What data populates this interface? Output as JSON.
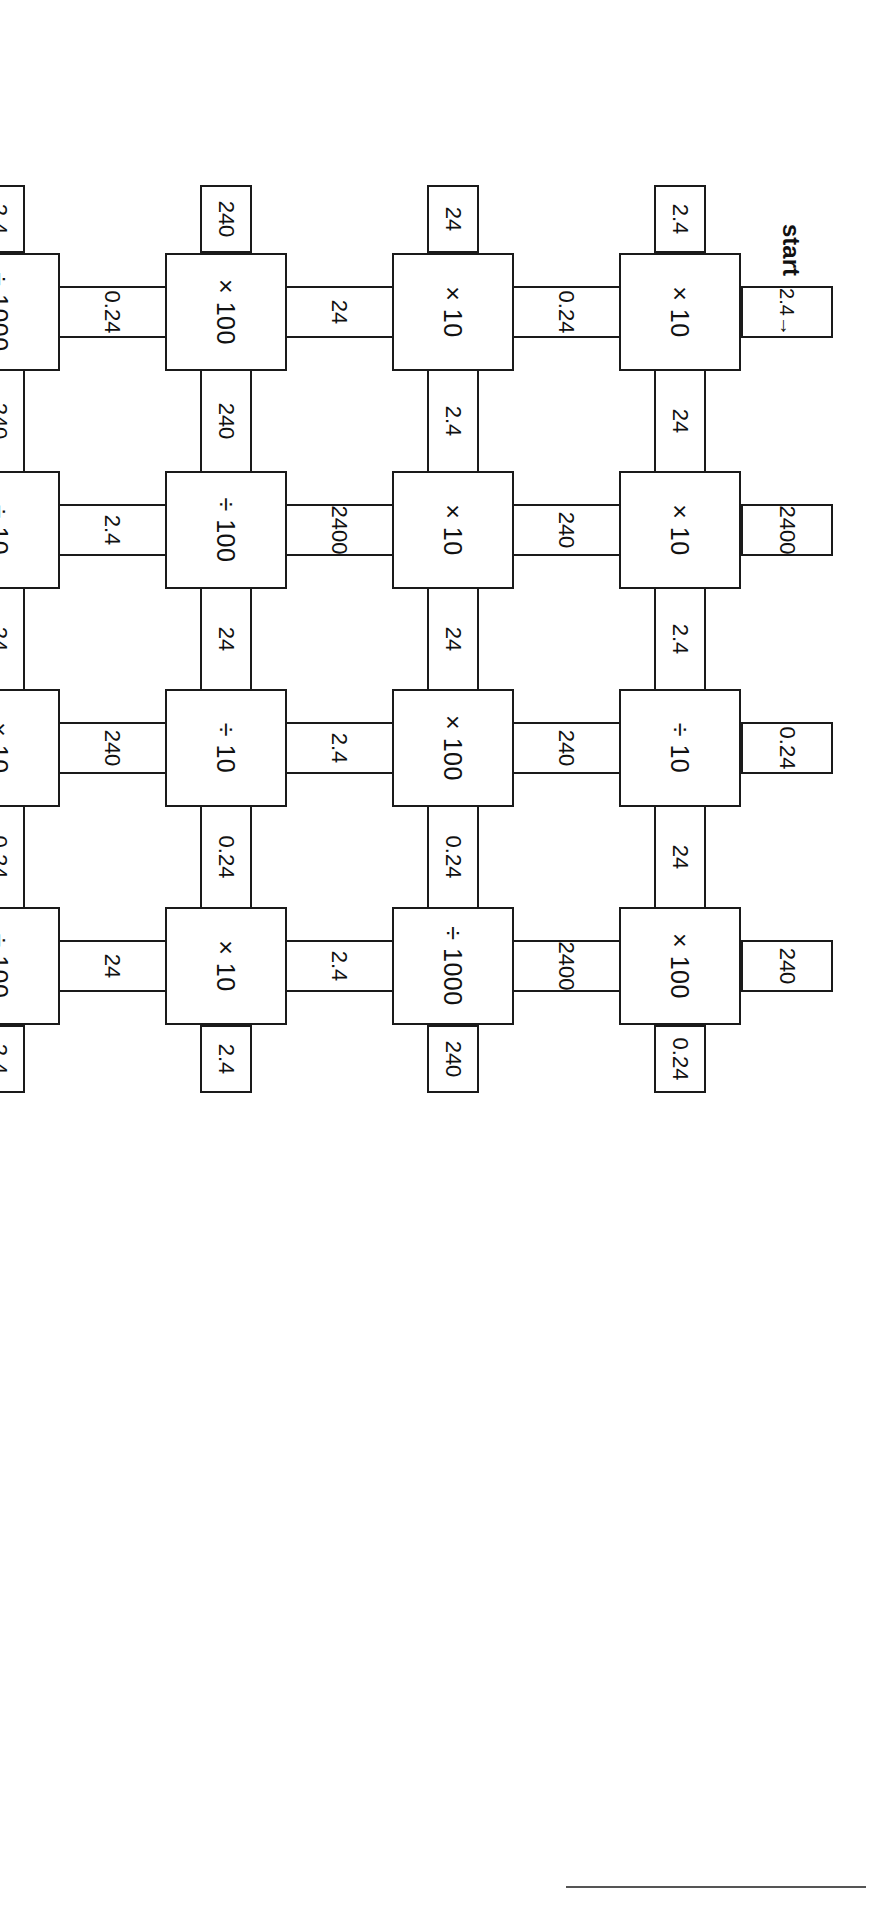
{
  "start": {
    "label": "start",
    "value": "2.4",
    "arrow": "→"
  },
  "grid": {
    "rows": 6,
    "cols": 4,
    "boxes": [
      [
        "× 10",
        "× 10",
        "÷ 10",
        "× 100"
      ],
      [
        "× 10",
        "× 10",
        "× 100",
        "÷ 1000"
      ],
      [
        "× 100",
        "÷ 100",
        "÷ 10",
        "× 10"
      ],
      [
        "÷ 1000",
        "÷ 10",
        "× 10",
        "÷ 100"
      ],
      [
        "× 1000",
        "× 20",
        "÷ 2",
        "× 10"
      ],
      [
        "÷ 100",
        "× 10",
        "× 10",
        "÷ 100"
      ]
    ],
    "h_connectors": [
      [
        "24",
        "2.4",
        "24"
      ],
      [
        "2.4",
        "24",
        "0.24"
      ],
      [
        "240",
        "24",
        "0.24"
      ],
      [
        "240",
        "24",
        "0.24"
      ],
      [
        "120",
        "240",
        "1.2"
      ],
      [
        "12",
        "1.2",
        "0.12"
      ]
    ],
    "v_connectors": [
      [
        "0.24",
        "240",
        "240",
        "2400"
      ],
      [
        "24",
        "2400",
        "2.4",
        "2.4"
      ],
      [
        "0.24",
        "2.4",
        "240",
        "24"
      ],
      [
        "1200",
        "2400",
        "2.4",
        "0.024"
      ],
      [
        "0.12",
        "0.12",
        "12",
        "12"
      ]
    ],
    "left_tails": [
      "2.4",
      "24",
      "240",
      "2.4",
      "120",
      "1.2"
    ],
    "right_tails": [
      "0.24",
      "240",
      "2.4",
      "2.4",
      "12",
      "1.2"
    ],
    "top_tails": [
      "2.4",
      "2400",
      "0.24",
      "240"
    ],
    "bottom_tails": [
      "0.012",
      "120",
      "0.012",
      "0.012"
    ]
  }
}
